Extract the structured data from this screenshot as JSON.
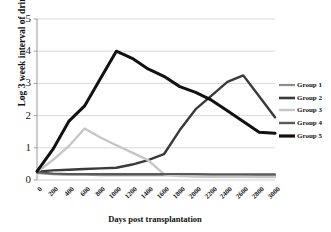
{
  "chart_data": {
    "type": "line",
    "title": "",
    "xlabel": "Days post transplantation",
    "ylabel": "Log 3 week interval of drinks",
    "xlim": [
      0,
      3000
    ],
    "ylim": [
      0,
      5
    ],
    "grid": "horizontal",
    "legend_position": "right",
    "x": [
      0,
      200,
      400,
      600,
      800,
      1000,
      1200,
      1400,
      1600,
      1800,
      2000,
      2200,
      2400,
      2600,
      2800,
      3000
    ],
    "xticks": [
      "0",
      "200",
      "400",
      "600",
      "800",
      "1000",
      "1200",
      "1400",
      "1600",
      "1800",
      "2000",
      "2200",
      "2400",
      "2600",
      "2800",
      "3000"
    ],
    "yticks": [
      "0",
      "1",
      "2",
      "3",
      "4",
      "5"
    ],
    "series": [
      {
        "name": "Group 1",
        "color": "#8c8c8c",
        "width": 2.0,
        "values": [
          0.22,
          0.18,
          0.16,
          0.16,
          0.15,
          0.15,
          0.15,
          0.15,
          0.15,
          0.15,
          0.15,
          0.14,
          0.14,
          0.14,
          0.14,
          0.14
        ]
      },
      {
        "name": "Group 2",
        "color": "#3a3a3a",
        "width": 2.4,
        "values": [
          0.26,
          0.3,
          0.32,
          0.34,
          0.36,
          0.38,
          0.48,
          0.62,
          0.8,
          1.55,
          2.2,
          2.62,
          3.05,
          3.25,
          2.6,
          1.95
        ]
      },
      {
        "name": "Group 3",
        "color": "#c6c6c6",
        "width": 2.4,
        "values": [
          0.25,
          0.62,
          1.05,
          1.6,
          1.32,
          1.08,
          0.85,
          0.62,
          0.18,
          0.12,
          0.11,
          0.1,
          0.1,
          0.1,
          0.09,
          0.09
        ]
      },
      {
        "name": "Group 4",
        "color": "#5a5a5a",
        "width": 2.0,
        "values": [
          0.24,
          0.2,
          0.19,
          0.19,
          0.19,
          0.19,
          0.19,
          0.19,
          0.19,
          0.19,
          0.19,
          0.18,
          0.18,
          0.18,
          0.18,
          0.18
        ]
      },
      {
        "name": "Group 5",
        "color": "#111111",
        "width": 3.0,
        "values": [
          0.27,
          0.95,
          1.82,
          2.3,
          3.15,
          4.0,
          3.78,
          3.45,
          3.22,
          2.9,
          2.72,
          2.48,
          2.15,
          1.82,
          1.48,
          1.45
        ]
      }
    ]
  },
  "legend": {
    "items": [
      {
        "label": "Group 1"
      },
      {
        "label": "Group 2"
      },
      {
        "label": "Group 3"
      },
      {
        "label": "Group 4"
      },
      {
        "label": "Group 5"
      }
    ]
  }
}
